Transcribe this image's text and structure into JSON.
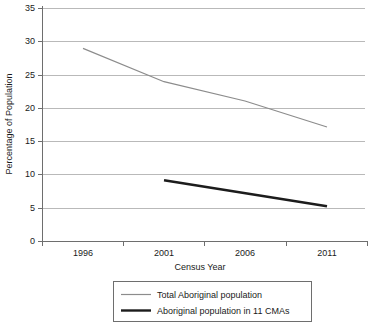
{
  "chart_data": {
    "type": "line",
    "title": "",
    "xlabel": "Census Year",
    "ylabel": "Percentage of Population",
    "categories": [
      "1996",
      "2001",
      "2006",
      "2011"
    ],
    "x": [
      1996,
      2001,
      2006,
      2011
    ],
    "ylim": [
      0,
      35
    ],
    "ytick_labels": [
      "0",
      "5",
      "10",
      "15",
      "20",
      "25",
      "30",
      "35"
    ],
    "ytick_values": [
      0,
      5,
      10,
      15,
      20,
      25,
      30,
      35
    ],
    "grid": "horizontal",
    "legend_position": "bottom-center",
    "series": [
      {
        "name": "Total Aboriginal population",
        "color": "#8c8c8c",
        "values": [
          29.0,
          24.0,
          21.1,
          17.2
        ]
      },
      {
        "name": "Aboriginal population in 11 CMAs",
        "color": "#1c1c1c",
        "values": [
          null,
          9.2,
          null,
          5.3
        ]
      }
    ]
  },
  "axes": {
    "y_title": "Percentage of Population",
    "x_title": "Census Year",
    "y_ticks": [
      {
        "label": "35",
        "value": 35
      },
      {
        "label": "30",
        "value": 30
      },
      {
        "label": "25",
        "value": 25
      },
      {
        "label": "20",
        "value": 20
      },
      {
        "label": "15",
        "value": 15
      },
      {
        "label": "10",
        "value": 10
      },
      {
        "label": "5",
        "value": 5
      },
      {
        "label": "0",
        "value": 0
      }
    ],
    "x_ticks": [
      {
        "label": "1996"
      },
      {
        "label": "2001"
      },
      {
        "label": "2006"
      },
      {
        "label": "2011"
      }
    ]
  },
  "legend": {
    "entries": [
      {
        "label": "Total Aboriginal population",
        "style": "thin-gray"
      },
      {
        "label": "Aboriginal population in 11 CMAs",
        "style": "thick-black"
      }
    ]
  }
}
